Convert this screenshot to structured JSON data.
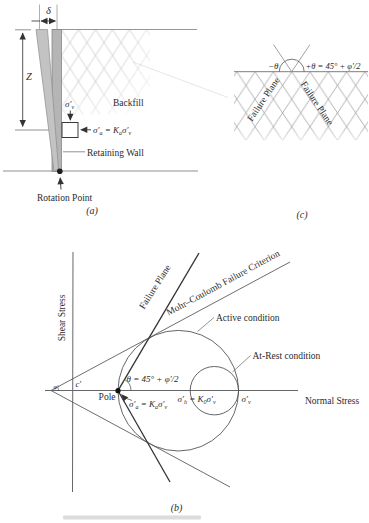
{
  "panel_a": {
    "caption": "(a)",
    "delta": "δ",
    "depth": "Z",
    "backfill": "Backfill",
    "retaining_wall": "Retaining Wall",
    "rotation_point": "Rotation Point",
    "sigma_v": {
      "base": "σ′",
      "sub": "v"
    },
    "sigma_a": {
      "p1": "σ′",
      "p2": "a",
      "p3": " = K",
      "p4": "a",
      "p5": "σ′",
      "p6": "v"
    }
  },
  "panel_c": {
    "caption": "(c)",
    "minus_theta": "−θ",
    "plus_theta": "+θ = 45° + φ′/2",
    "failure_plane_left": "Failure Plane",
    "failure_plane_right": "Failure Plane"
  },
  "panel_b": {
    "caption": "(b)",
    "y_axis_label": "Shear Stress",
    "x_axis_label": "Normal Stress",
    "failure_plane": "Failure Plane",
    "mohr_coulomb": "Mohr–Coulomb Failure Criterion",
    "active": "Active condition",
    "at_rest": "At-Rest condition",
    "pole": "Pole",
    "theta": "θ = 45° + φ′/2",
    "c_prime": "c′",
    "phi_prime": "φ′",
    "sigma_a": {
      "p1": "σ′",
      "p2": "a",
      "p3": " = K",
      "p4": "a",
      "p5": "σ′",
      "p6": "v"
    },
    "sigma_h": {
      "p1": "σ′",
      "p2": "h",
      "p3": " = K",
      "p4": "0",
      "p5": "σ′",
      "p6": "v"
    },
    "sigma_v": {
      "base": "σ′",
      "sub": "v"
    }
  },
  "colors": {
    "wall_gray": "#b5b5b5",
    "tilted_wall_gray": "#c3c3c3",
    "dark_line": "#333333",
    "mid_line": "#555555",
    "hatch_light": "#c9c9c9",
    "hatch_dark": "#9f9f9f"
  }
}
